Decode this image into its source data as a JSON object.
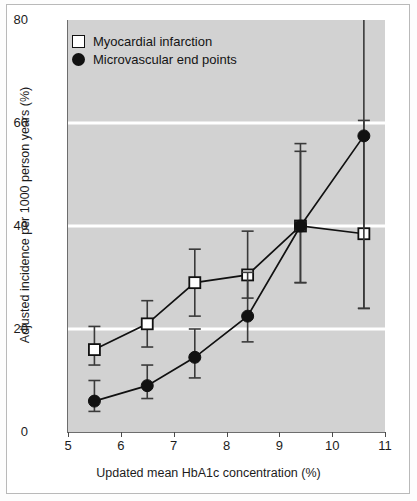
{
  "chart_data": {
    "type": "line",
    "title": "",
    "xlabel": "Updated mean HbA1c concentration (%)",
    "ylabel": "Adjusted incidence per 1000 person years (%)",
    "xlim": [
      5,
      11
    ],
    "ylim": [
      0,
      80
    ],
    "xticks": [
      "5",
      "6",
      "7",
      "8",
      "9",
      "10",
      "11"
    ],
    "yticks": [
      "0",
      "20",
      "40",
      "60",
      "80"
    ],
    "grid": "horizontal-white-gridlines-at-20-40-60",
    "legend_position": "top-left-inside",
    "plot_background": "#d2d2d2",
    "gridline_color": "#ffffff",
    "series": [
      {
        "name": "Myocardial infarction",
        "marker": "open-square",
        "marker_fill": "#ffffff",
        "marker_stroke": "#111111",
        "x": [
          5.5,
          6.5,
          7.4,
          8.4,
          9.4,
          10.6
        ],
        "values": [
          16,
          21,
          29,
          30.5,
          40,
          38.5
        ],
        "ci_low": [
          13,
          16.5,
          22.5,
          26,
          29,
          24
        ],
        "ci_high": [
          20.5,
          25.5,
          35.5,
          39,
          56,
          60.5
        ]
      },
      {
        "name": "Microvascular end points",
        "marker": "filled-circle",
        "marker_fill": "#111111",
        "marker_stroke": "#111111",
        "x": [
          5.5,
          6.5,
          7.4,
          8.4,
          9.4,
          10.6
        ],
        "values": [
          6,
          9,
          14.5,
          22.5,
          40,
          57.5
        ],
        "ci_low": [
          4,
          6.5,
          10.5,
          17.5,
          29,
          24
        ],
        "ci_high": [
          10,
          13,
          20,
          31,
          54.5,
          80
        ]
      }
    ]
  },
  "legend": {
    "items": [
      {
        "label": "Myocardial infarction"
      },
      {
        "label": "Microvascular end points"
      }
    ]
  },
  "axes": {
    "x_title": "Updated mean HbA1c concentration (%)",
    "y_title": "Adjusted incidence per 1000 person years (%)"
  }
}
